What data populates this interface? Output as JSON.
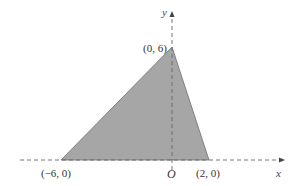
{
  "diagram": {
    "type": "coordinate-plane-triangle",
    "axes": {
      "x_label": "x",
      "y_label": "y",
      "origin_label": "O",
      "style": "dashed"
    },
    "triangle": {
      "fill": "#a6a6a6",
      "stroke": "#6e6e6e",
      "vertices": [
        {
          "label": "(−6, 0)",
          "x": -6,
          "y": 0
        },
        {
          "label": "(0, 6)",
          "x": 0,
          "y": 6
        },
        {
          "label": "(2, 0)",
          "x": 2,
          "y": 0
        }
      ]
    }
  }
}
